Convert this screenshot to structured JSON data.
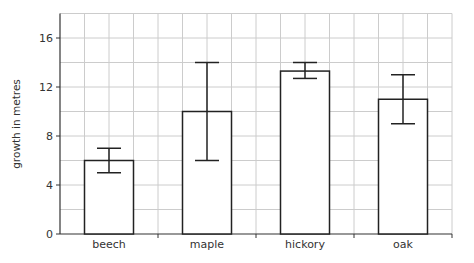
{
  "chart_data": {
    "type": "bar",
    "title": "",
    "xlabel": "",
    "ylabel": "growth in metres",
    "ylim": [
      0,
      18
    ],
    "yticks": [
      0,
      4,
      8,
      12,
      16
    ],
    "grid": true,
    "categories": [
      "beech",
      "maple",
      "hickory",
      "oak"
    ],
    "values": [
      6,
      10,
      13.3,
      11
    ],
    "error_bars": [
      {
        "low": 5,
        "high": 7
      },
      {
        "low": 6,
        "high": 14
      },
      {
        "low": 12.7,
        "high": 14
      },
      {
        "low": 9,
        "high": 13
      }
    ],
    "colors": {
      "bar_fill": "#ffffff",
      "bar_stroke": "#222222",
      "grid": "#cccccc",
      "axis": "#333333"
    }
  }
}
